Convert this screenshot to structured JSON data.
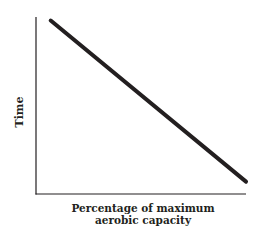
{
  "chart_data": {
    "type": "line",
    "title": "",
    "xlabel_line1": "Percentage of maximum",
    "xlabel_line2": "aerobic capacity",
    "xlabel": "Percentage of maximum aerobic capacity",
    "ylabel": "Time",
    "x": [
      0.07,
      1.0
    ],
    "series": [
      {
        "name": "Time",
        "values": [
          0.98,
          0.07
        ]
      }
    ],
    "xlim": [
      0,
      1
    ],
    "ylim": [
      0,
      1
    ],
    "grid": false,
    "ticks": false,
    "legend": null,
    "colors": {
      "line": "#231f20",
      "axis": "#231f20"
    }
  }
}
